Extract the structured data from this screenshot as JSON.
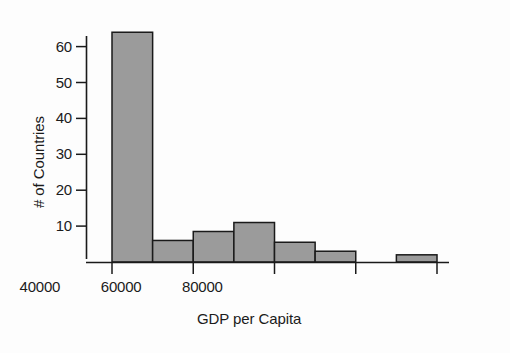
{
  "chart_data": {
    "type": "bar",
    "title": "",
    "subtitle": "",
    "xlabel": "GDP per Capita",
    "ylabel": "# of Countries",
    "bin_edges": [
      0,
      10000,
      20000,
      30000,
      40000,
      50000,
      60000,
      70000,
      80000
    ],
    "categories": [
      "0-10000",
      "10000-20000",
      "20000-30000",
      "30000-40000",
      "40000-50000",
      "50000-60000",
      "60000-70000",
      "70000-80000"
    ],
    "values": [
      64,
      6,
      8.5,
      11,
      5.5,
      3,
      0,
      2
    ],
    "xlim": [
      0,
      80000
    ],
    "ylim": [
      0,
      66
    ],
    "xticks": [
      0,
      20000,
      40000,
      60000,
      80000
    ],
    "xtick_labels": [
      "0",
      "20000",
      "40000",
      "60000",
      "80000"
    ],
    "yticks": [
      10,
      20,
      30,
      40,
      50,
      60
    ],
    "ytick_labels": [
      "10",
      "20",
      "30",
      "40",
      "50",
      "60"
    ],
    "grid": false,
    "legend": "none",
    "bar_fill": "#9b9b9b",
    "bar_edge": "#1a1a1a",
    "axis_color": "#1a1a1a",
    "background": "#fdfdfd"
  }
}
